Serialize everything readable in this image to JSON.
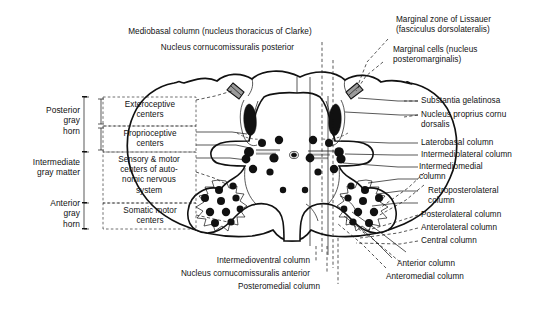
{
  "figure": {
    "type": "anatomical-diagram"
  },
  "labels_top": {
    "mediobasal": "Mediobasal column (nucleus thoracicus of Clarke)",
    "cornucommissuralis_posterior": "Nucleus cornucomissuralis posterior"
  },
  "labels_top_right": {
    "lissauer": "Marginal zone of Lissauer\n(fasciculus dorsolateralis)",
    "marginal_cells": "Marginal cells (nucleus\nposteromarginalis)"
  },
  "labels_right": [
    {
      "id": "substantia-gelatinosa",
      "text": "Substantia gelatinosa"
    },
    {
      "id": "nucleus-proprius",
      "text": "Nucleus proprius cornu\ndorsalis"
    },
    {
      "id": "laterobasal-column",
      "text": "Laterobasal column"
    },
    {
      "id": "intermediolateral-column",
      "text": "Intermediolateral column"
    },
    {
      "id": "intermediomedial-column",
      "text": "Intermediomedial\ncolumn"
    },
    {
      "id": "retroposterolateral-column",
      "text": "Retroposterolateral\ncolumn"
    },
    {
      "id": "posterolateral-column",
      "text": "Posterolateral column"
    },
    {
      "id": "anterolateral-column",
      "text": "Anterolateral column"
    },
    {
      "id": "central-column",
      "text": "Central column"
    },
    {
      "id": "anterior-column",
      "text": "Anterior column"
    },
    {
      "id": "anteromedial-column",
      "text": "Anteromedial column"
    }
  ],
  "labels_bottom": [
    {
      "id": "intermedioventral-column",
      "text": "Intermedioventral column"
    },
    {
      "id": "nucleus-cornucomissuralis-anterior",
      "text": "Nucleus cornucomissuralis anterior"
    },
    {
      "id": "posteromedial-column",
      "text": "Posteromedial column"
    }
  ],
  "regions_left": [
    {
      "id": "posterior-gray-horn",
      "text": "Posterior\ngray\nhorn"
    },
    {
      "id": "intermediate-gray-matter",
      "text": "Intermediate\ngray matter"
    },
    {
      "id": "anterior-gray-horn",
      "text": "Anterior\ngray\nhorn"
    }
  ],
  "functional_centers": [
    {
      "id": "exteroceptive-centers",
      "text": "Exteroceptive\ncenters"
    },
    {
      "id": "proprioceptive-centers",
      "text": "Proprioceptive\ncenters"
    },
    {
      "id": "autonomic-centers",
      "text": "Sensory & motor\ncenters of auto-\nnomic nervous\nsystem"
    },
    {
      "id": "somatic-motor-centers",
      "text": "Somatic motor\ncenters"
    }
  ],
  "colors": {
    "ink": "#111111",
    "paper": "#ffffff",
    "root_gray": "#9b9b9b"
  }
}
